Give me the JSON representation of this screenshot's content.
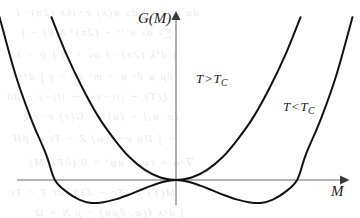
{
  "figure": {
    "kind": "landau-free-energy-plot",
    "background_color": "#ffffff",
    "curve_color": "#121212",
    "axis_color": "#6a6a6a",
    "label_color": "#1a1a1a"
  },
  "axes": {
    "y_axis_label": "G(M)",
    "x_axis_label": "M",
    "origin_px": {
      "x": 176,
      "y": 180
    },
    "x_axis_extent_px": {
      "from": 17,
      "to": 345
    },
    "y_axis_extent_px": {
      "from": 205,
      "to": 14
    },
    "arrowheads": [
      "y-axis-top",
      "x-axis-right"
    ],
    "tick_labels": [],
    "grid": false
  },
  "annotations": [
    {
      "id": "t-greater",
      "symbol": "T",
      "relation": ">",
      "reference": "T",
      "reference_subscript": "C",
      "text": "T > T_C",
      "position_px": {
        "x": 196,
        "y": 72
      }
    },
    {
      "id": "t-less",
      "symbol": "T",
      "relation": "<",
      "reference": "T",
      "reference_subscript": "C",
      "text": "T < T_C",
      "position_px": {
        "x": 283,
        "y": 100
      }
    }
  ],
  "ghost_text": {
    "description": "faint scanner bleed-through from reverse of page",
    "lines": [
      {
        "text": "dφ̃ (x) = ∫ dx φ(x) e−ikx  (2π)−1",
        "x": 14,
        "y": 6,
        "size": 11
      },
      {
        "text": "∑ₖ φₖ eⁱᵏˣ + (2π)³ δ(k) − ∫",
        "x": 20,
        "y": 26,
        "size": 11
      },
      {
        "text": "∫ d³k (2π)−3 φₖ + ½ ∫ ψ − λ²",
        "x": 10,
        "y": 48,
        "size": 11
      },
      {
        "text": "∂μ φ ∂ᵘ φ − m² φ² = γ ∫ d⁴x",
        "x": 16,
        "y": 70,
        "size": 11
      },
      {
        "text": "ξ(T) ∼ |t|−ν  χ ∼ |t|−γ − βδ",
        "x": 6,
        "y": 90,
        "size": 11
      },
      {
        "text": "⟨σᵢ σⱼ⟩ − ⟨σ⟩² = G(r)  e−r/ξ",
        "x": 22,
        "y": 110,
        "size": 11
      },
      {
        "text": "= ∫ Dφ e−S[φ]  Z = Tr e−βH",
        "x": 12,
        "y": 132,
        "size": 11
      },
      {
        "text": "∇²φ + rφ + uφ³ = 0  (∂F/∂M)",
        "x": 28,
        "y": 156,
        "size": 11
      },
      {
        "text": "M(T) ∝ (Tᴄ − T)β for T < Tᴄ",
        "x": 8,
        "y": 186,
        "size": 11
      },
      {
        "text": "∫ dᵈx ℓ(φ, ∂μφ) − μ N + Ω",
        "x": 34,
        "y": 206,
        "size": 11
      }
    ]
  },
  "chart_data": {
    "type": "line",
    "title": "",
    "xlabel": "M",
    "ylabel": "G(M)",
    "xlim": [
      -1.2,
      1.2
    ],
    "ylim": [
      -0.18,
      1.15
    ],
    "grid": false,
    "legend": "inline-annotations",
    "series": [
      {
        "name": "T > T_C",
        "label": "T > T_C",
        "form": "G(M) = a M^2, a > 0",
        "shape": "single-well parabola with unique minimum at M = 0",
        "minima": [
          {
            "M": 0.0,
            "G": 0.0
          }
        ],
        "maxima": [],
        "x": [
          -0.72,
          -0.63,
          -0.54,
          -0.45,
          -0.36,
          -0.27,
          -0.18,
          -0.09,
          0.0,
          0.09,
          0.18,
          0.27,
          0.36,
          0.45,
          0.54,
          0.63,
          0.72
        ],
        "y": [
          1.1,
          0.84,
          0.62,
          0.43,
          0.28,
          0.155,
          0.069,
          0.017,
          0.0,
          0.017,
          0.069,
          0.155,
          0.28,
          0.43,
          0.62,
          0.84,
          1.1
        ],
        "stroke": "#121212",
        "stroke_width": 2.0
      },
      {
        "name": "T < T_C",
        "label": "T < T_C",
        "form": "G(M) = -b M^2 + c M^4, b, c > 0",
        "shape": "symmetric double well with degenerate minima at M = +/- M0 and local maximum at M = 0",
        "minima": [
          {
            "M": -0.49,
            "G": -0.155
          },
          {
            "M": 0.49,
            "G": -0.155
          }
        ],
        "maxima": [
          {
            "M": 0.0,
            "G": 0.0
          }
        ],
        "zeros": [
          {
            "M": -0.7,
            "G": 0.0
          },
          {
            "M": 0.0,
            "G": 0.0
          },
          {
            "M": 0.7,
            "G": 0.0
          }
        ],
        "x": [
          -1.02,
          -0.93,
          -0.84,
          -0.75,
          -0.7,
          -0.63,
          -0.56,
          -0.49,
          -0.42,
          -0.35,
          -0.28,
          -0.21,
          -0.14,
          -0.07,
          0.0,
          0.07,
          0.14,
          0.21,
          0.28,
          0.35,
          0.42,
          0.49,
          0.56,
          0.63,
          0.7,
          0.75,
          0.84,
          0.93,
          1.02
        ],
        "y": [
          1.1,
          0.72,
          0.42,
          0.17,
          0.0,
          -0.082,
          -0.132,
          -0.155,
          -0.15,
          -0.131,
          -0.103,
          -0.07,
          -0.038,
          -0.012,
          0.0,
          -0.012,
          -0.038,
          -0.07,
          -0.103,
          -0.131,
          -0.15,
          -0.155,
          -0.132,
          -0.082,
          0.0,
          0.17,
          0.42,
          0.72,
          1.1
        ],
        "stroke": "#121212",
        "stroke_width": 2.0
      }
    ]
  }
}
